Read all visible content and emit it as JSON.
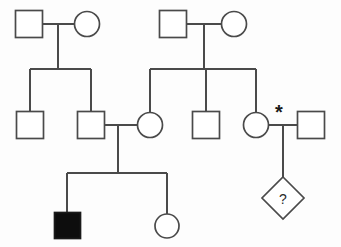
{
  "diagram": {
    "type": "pedigree-chart",
    "width": 341,
    "height": 247,
    "colors": {
      "background": "#fdfdfd",
      "line": "#4a4a4a",
      "symbol_outline": "#4a4a4a",
      "symbol_fill_affected": "#0d0d0d",
      "symbol_fill_unaffected": "#ffffff",
      "glyph_text": "#2b2b2b"
    },
    "legend_notes": {
      "square": "male",
      "circle": "female",
      "diamond": "unknown sex / pregnancy",
      "filled": "affected",
      "half_filled": "carrier",
      "open": "unaffected",
      "asterisk": "proband or noted individual",
      "question_mark": "unknown phenotype"
    }
  },
  "generations": [
    {
      "id": "generation-1",
      "label": "I",
      "individuals": [
        {
          "id": "i-1",
          "name": "individual-i-1",
          "shape": "square",
          "sex": "male",
          "status": "unaffected",
          "fill": "open",
          "label": "",
          "cx": 29,
          "cy": 24,
          "size": 27
        },
        {
          "id": "i-2",
          "name": "individual-i-2",
          "shape": "circle",
          "sex": "female",
          "status": "carrier",
          "fill": "half-right",
          "label": "",
          "cx": 87,
          "cy": 24,
          "size": 25
        },
        {
          "id": "i-3",
          "name": "individual-i-3",
          "shape": "square",
          "sex": "male",
          "status": "carrier",
          "fill": "half-right",
          "label": "",
          "cx": 173,
          "cy": 24,
          "size": 27
        },
        {
          "id": "i-4",
          "name": "individual-i-4",
          "shape": "circle",
          "sex": "female",
          "status": "unaffected",
          "fill": "open",
          "label": "",
          "cx": 234,
          "cy": 24,
          "size": 25
        }
      ]
    },
    {
      "id": "generation-2",
      "label": "II",
      "individuals": [
        {
          "id": "ii-1",
          "name": "individual-ii-1",
          "shape": "square",
          "sex": "male",
          "status": "unaffected",
          "fill": "open",
          "label": "",
          "cx": 30,
          "cy": 125,
          "size": 27
        },
        {
          "id": "ii-2",
          "name": "individual-ii-2",
          "shape": "square",
          "sex": "male",
          "status": "carrier",
          "fill": "half-right",
          "label": "",
          "cx": 91,
          "cy": 125,
          "size": 27
        },
        {
          "id": "ii-3",
          "name": "individual-ii-3",
          "shape": "circle",
          "sex": "female",
          "status": "carrier",
          "fill": "half-right",
          "label": "",
          "cx": 150,
          "cy": 125,
          "size": 25
        },
        {
          "id": "ii-4",
          "name": "individual-ii-4",
          "shape": "square",
          "sex": "male",
          "status": "unaffected",
          "fill": "open",
          "label": "",
          "cx": 206,
          "cy": 125,
          "size": 27
        },
        {
          "id": "ii-5",
          "name": "individual-ii-5",
          "shape": "circle",
          "sex": "female",
          "status": "unaffected",
          "fill": "open",
          "label": "",
          "cx": 256,
          "cy": 125,
          "size": 25
        },
        {
          "id": "ii-6",
          "name": "individual-ii-6",
          "shape": "square",
          "sex": "male",
          "status": "carrier",
          "fill": "half-right",
          "label": "",
          "cx": 311,
          "cy": 125,
          "size": 27
        }
      ]
    },
    {
      "id": "generation-3",
      "label": "III",
      "individuals": [
        {
          "id": "iii-1",
          "name": "individual-iii-1",
          "shape": "square",
          "sex": "male",
          "status": "affected",
          "fill": "full",
          "label": "",
          "cx": 67,
          "cy": 225,
          "size": 26
        },
        {
          "id": "iii-2",
          "name": "individual-iii-2",
          "shape": "circle",
          "sex": "female",
          "status": "unaffected",
          "fill": "open",
          "label": "",
          "cx": 167,
          "cy": 226,
          "size": 24
        },
        {
          "id": "iii-3",
          "name": "individual-iii-3",
          "shape": "diamond",
          "sex": "unknown",
          "status": "unknown",
          "fill": "open",
          "label": "?",
          "cx": 283,
          "cy": 198,
          "size": 42
        }
      ]
    }
  ],
  "annotations": [
    {
      "id": "asterisk-1",
      "name": "asterisk-marker",
      "symbol": "*",
      "x": 279,
      "y": 110
    }
  ],
  "matings": [
    {
      "id": "mating-1",
      "name": "mating-line-i1-i2",
      "partners": [
        "i-1",
        "i-2"
      ],
      "children": [
        "ii-1",
        "ii-2"
      ]
    },
    {
      "id": "mating-2",
      "name": "mating-line-i3-i4",
      "partners": [
        "i-3",
        "i-4"
      ],
      "children": [
        "ii-3",
        "ii-4",
        "ii-5"
      ]
    },
    {
      "id": "mating-3",
      "name": "mating-line-ii2-ii3",
      "partners": [
        "ii-2",
        "ii-3"
      ],
      "children": [
        "iii-1",
        "iii-2"
      ]
    },
    {
      "id": "mating-4",
      "name": "mating-line-ii5-ii6",
      "partners": [
        "ii-5",
        "ii-6"
      ],
      "children": [
        "iii-3"
      ]
    }
  ]
}
